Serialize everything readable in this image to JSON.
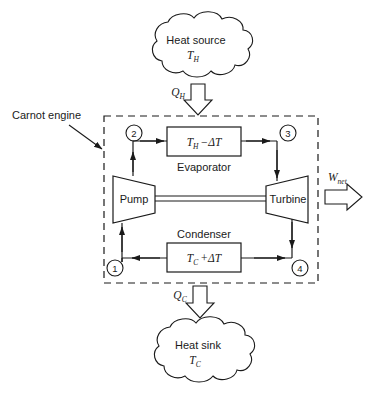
{
  "diagram": {
    "boundary_label": "Carnot engine",
    "source_cloud": {
      "line1": "Heat source",
      "line2_base": "T",
      "line2_sub": "H"
    },
    "sink_cloud": {
      "line1": "Heat sink",
      "line2_base": "T",
      "line2_sub": "C"
    },
    "heat_in": {
      "base": "Q",
      "sub": "H"
    },
    "heat_out": {
      "base": "Q",
      "sub": "C"
    },
    "work_out": {
      "base": "W",
      "sub": "net"
    },
    "evaporator": {
      "caption": "Evaporator",
      "temp_base": "T",
      "temp_sub": "H",
      "temp_delta": "−ΔT"
    },
    "condenser": {
      "caption": "Condenser",
      "temp_base": "T",
      "temp_sub": "C",
      "temp_delta": "+ΔT"
    },
    "pump": {
      "label": "Pump"
    },
    "turbine": {
      "label": "Turbine"
    },
    "states": [
      {
        "id": "1",
        "label": "1"
      },
      {
        "id": "2",
        "label": "2"
      },
      {
        "id": "3",
        "label": "3"
      },
      {
        "id": "4",
        "label": "4"
      }
    ],
    "colors": {
      "stroke": "#1a1a1a",
      "text": "#1a1a1a",
      "background": "#ffffff"
    }
  }
}
